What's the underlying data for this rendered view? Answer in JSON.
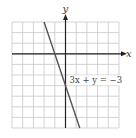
{
  "chart_data": {
    "type": "line",
    "title": "",
    "xlabel": "x",
    "ylabel": "y",
    "xlim": [
      -5,
      5
    ],
    "ylim": [
      -7,
      3
    ],
    "grid": true,
    "grid_step": 1,
    "tick_labels": false,
    "series": [
      {
        "name": "3x + y = −3",
        "equation": "y = -3x - 3",
        "x": [
          -2,
          1.3333
        ],
        "y": [
          3,
          -7
        ],
        "color": "#555555"
      }
    ],
    "annotations": [
      {
        "text": "3x + y = −3",
        "x": 0.1,
        "y": -2.5
      }
    ]
  },
  "labels": {
    "x_axis": "x",
    "y_axis": "y",
    "equation": "3x + y = −3"
  },
  "colors": {
    "grid": "#c8c8c8",
    "axis": "#222222",
    "line": "#555555",
    "background": "#ffffff"
  }
}
